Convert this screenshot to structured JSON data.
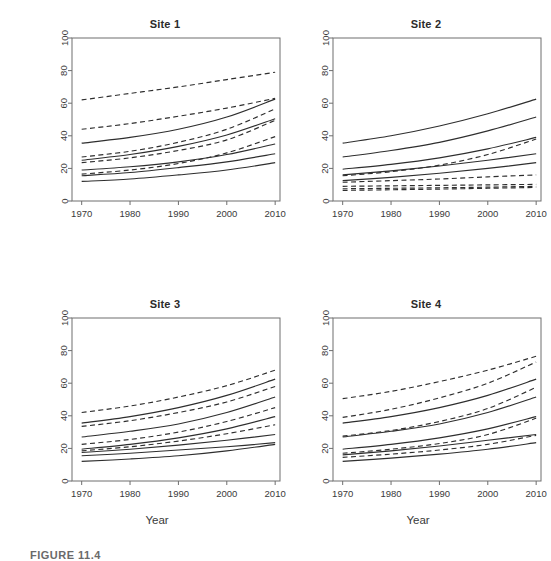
{
  "figure": {
    "ylabel": "Chloride (mg/L) at median discharge = 43.5 cfs",
    "xlabel_bottom_left": "Year",
    "xlabel_bottom_right": "Year",
    "caption": "FIGURE 11.4"
  },
  "axes": {
    "x_ticks": [
      "1970",
      "1980",
      "1990",
      "2000",
      "2010"
    ],
    "x_values": [
      1970,
      1980,
      1990,
      2000,
      2010
    ],
    "y_ticks": [
      "0",
      "20",
      "40",
      "60",
      "80",
      "100"
    ],
    "y_values": [
      0,
      20,
      40,
      60,
      80,
      100
    ],
    "xlim": [
      1968,
      2011
    ],
    "ylim": [
      0,
      100
    ]
  },
  "panels": [
    {
      "title": "Site 1"
    },
    {
      "title": "Site 2"
    },
    {
      "title": "Site 3"
    },
    {
      "title": "Site 4"
    }
  ],
  "chart_data": {
    "type": "line",
    "xlabel": "Year",
    "ylabel": "Chloride (mg/L) at median discharge = 43.5 cfs",
    "xlim": [
      1968,
      2011
    ],
    "ylim": [
      0,
      100
    ],
    "x": [
      1970,
      1980,
      1990,
      2000,
      2010
    ],
    "grid": false,
    "legend": "none",
    "line_styles": {
      "solid": "model estimate",
      "dashed": "confidence / prediction bound"
    },
    "panels": [
      {
        "title": "Site 1",
        "series": [
          {
            "name": "S1-dash-1",
            "style": "dashed",
            "values": [
              62,
              66,
              70,
              74.5,
              79
            ]
          },
          {
            "name": "S1-dash-2",
            "style": "dashed",
            "values": [
              44,
              47.5,
              52,
              57,
              63
            ]
          },
          {
            "name": "S1-solid-1",
            "style": "solid",
            "values": [
              35.5,
              39,
              44,
              51.5,
              62.5
            ]
          },
          {
            "name": "S1-dash-3",
            "style": "dashed",
            "values": [
              27,
              30.5,
              36,
              44,
              56.5
            ]
          },
          {
            "name": "S1-solid-2",
            "style": "solid",
            "values": [
              25,
              28.5,
              33.5,
              40.5,
              50.5
            ]
          },
          {
            "name": "S1-dash-4",
            "style": "dashed",
            "values": [
              23.5,
              26.5,
              31,
              37.5,
              49.5
            ]
          },
          {
            "name": "S1-solid-3",
            "style": "solid",
            "values": [
              19,
              21,
              24,
              28.5,
              35
            ]
          },
          {
            "name": "S1-dash-5",
            "style": "dashed",
            "values": [
              16.5,
              19,
              23,
              29.5,
              39.5
            ]
          },
          {
            "name": "S1-solid-4",
            "style": "solid",
            "values": [
              15.5,
              17.5,
              20.5,
              24,
              29
            ]
          },
          {
            "name": "S1-solid-5",
            "style": "solid",
            "values": [
              12,
              13.5,
              16,
              19,
              23.5
            ]
          }
        ]
      },
      {
        "title": "Site 2",
        "series": [
          {
            "name": "S2-solid-1",
            "style": "solid",
            "values": [
              35.5,
              40,
              46,
              53.5,
              62.5
            ]
          },
          {
            "name": "S2-solid-2",
            "style": "solid",
            "values": [
              27,
              31,
              36,
              43,
              51.5
            ]
          },
          {
            "name": "S2-solid-3",
            "style": "solid",
            "values": [
              19.5,
              22.5,
              26.5,
              32,
              39
            ]
          },
          {
            "name": "S2-dash-1",
            "style": "dashed",
            "values": [
              15.5,
              18,
              22,
              28.5,
              38
            ]
          },
          {
            "name": "S2-solid-4",
            "style": "solid",
            "values": [
              16,
              18.5,
              21.5,
              25,
              29
            ]
          },
          {
            "name": "S2-solid-5",
            "style": "solid",
            "values": [
              12.5,
              14.5,
              17,
              20,
              23.5
            ]
          },
          {
            "name": "S2-dash-2",
            "style": "dashed",
            "values": [
              11.5,
              12.5,
              13.5,
              14.8,
              16
            ]
          },
          {
            "name": "S2-dash-3",
            "style": "dashed",
            "values": [
              9,
              9.3,
              9.6,
              9.9,
              10.2
            ]
          },
          {
            "name": "S2-dash-4",
            "style": "dashed",
            "values": [
              7.5,
              7.8,
              8.1,
              8.5,
              9
            ]
          },
          {
            "name": "S2-dash-5",
            "style": "dashed",
            "values": [
              6.5,
              6.9,
              7.3,
              7.8,
              8.3
            ]
          }
        ]
      },
      {
        "title": "Site 3",
        "series": [
          {
            "name": "S3-dash-1",
            "style": "dashed",
            "values": [
              42,
              46,
              51.5,
              58.5,
              68
            ]
          },
          {
            "name": "S3-solid-1",
            "style": "solid",
            "values": [
              35.5,
              39.5,
              45,
              52.5,
              62.5
            ]
          },
          {
            "name": "S3-dash-2",
            "style": "dashed",
            "values": [
              33.5,
              37,
              42,
              48.5,
              58
            ]
          },
          {
            "name": "S3-solid-2",
            "style": "solid",
            "values": [
              27,
              30.5,
              35,
              42,
              51.5
            ]
          },
          {
            "name": "S3-dash-3",
            "style": "dashed",
            "values": [
              22.5,
              25.5,
              30,
              36.5,
              45
            ]
          },
          {
            "name": "S3-solid-3",
            "style": "solid",
            "values": [
              19.5,
              22.5,
              26.5,
              32,
              39.5
            ]
          },
          {
            "name": "S3-dash-4",
            "style": "dashed",
            "values": [
              18.5,
              21,
              24.5,
              29,
              34.5
            ]
          },
          {
            "name": "S3-solid-4",
            "style": "solid",
            "values": [
              17.5,
              19.5,
              22,
              25,
              28.5
            ]
          },
          {
            "name": "S3-solid-5",
            "style": "solid",
            "values": [
              15.5,
              17,
              19,
              21,
              23.5
            ]
          },
          {
            "name": "S3-solid-6",
            "style": "solid",
            "values": [
              12,
              13.5,
              15.5,
              18.5,
              22.5
            ]
          }
        ]
      },
      {
        "title": "Site 4",
        "series": [
          {
            "name": "S4-dash-1",
            "style": "dashed",
            "values": [
              50.5,
              55,
              61,
              68,
              76.5
            ]
          },
          {
            "name": "S4-dash-2",
            "style": "dashed",
            "values": [
              39,
              44,
              51,
              60,
              73
            ]
          },
          {
            "name": "S4-solid-1",
            "style": "solid",
            "values": [
              35.5,
              39.5,
              45,
              52.5,
              62.5
            ]
          },
          {
            "name": "S4-dash-3",
            "style": "dashed",
            "values": [
              27.5,
              31,
              36.5,
              44.5,
              57.5
            ]
          },
          {
            "name": "S4-solid-2",
            "style": "solid",
            "values": [
              27,
              30.5,
              35,
              42,
              51.5
            ]
          },
          {
            "name": "S4-solid-3",
            "style": "solid",
            "values": [
              19.5,
              22.5,
              26.5,
              32,
              39.5
            ]
          },
          {
            "name": "S4-dash-4",
            "style": "dashed",
            "values": [
              17,
              19.5,
              23,
              28.5,
              38.5
            ]
          },
          {
            "name": "S4-solid-4",
            "style": "solid",
            "values": [
              16,
              18.5,
              21.5,
              25,
              28.5
            ]
          },
          {
            "name": "S4-dash-5",
            "style": "dashed",
            "values": [
              14.5,
              16.5,
              19,
              22.5,
              28
            ]
          },
          {
            "name": "S4-solid-5",
            "style": "solid",
            "values": [
              12,
              14,
              16.5,
              19.5,
              23.5
            ]
          }
        ]
      }
    ]
  }
}
